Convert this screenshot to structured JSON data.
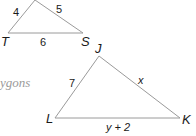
{
  "caption": "ygons",
  "triangle_rst": {
    "vertices": {
      "T": "T",
      "S": "S"
    },
    "sides": {
      "left": "4",
      "right": "5",
      "bottom": "6"
    }
  },
  "triangle_jkl": {
    "vertices": {
      "J": "J",
      "L": "L",
      "K": "K"
    },
    "sides": {
      "JL": "7",
      "JK": "x",
      "LK": "y + 2"
    }
  },
  "colors": {
    "line": "#9a9a9a",
    "text": "#1a1a1a"
  }
}
